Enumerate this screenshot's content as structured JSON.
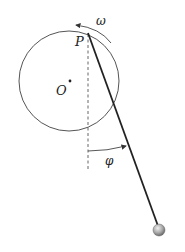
{
  "diagram": {
    "labels": {
      "pivot": "P",
      "center": "O",
      "angular_velocity": "ω",
      "angle": "φ"
    },
    "colors": {
      "line": "#333333",
      "rod": "#222222",
      "ball_light": "#dddddd",
      "ball_dark": "#777777"
    }
  }
}
